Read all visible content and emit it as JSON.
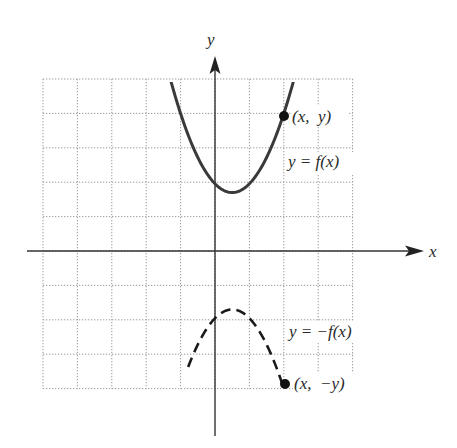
{
  "figure": {
    "axes": {
      "x_label": "x",
      "y_label": "y"
    },
    "grid": {
      "x_min": -5,
      "x_max": 4,
      "y_min": -4,
      "y_max": 5,
      "step": 1,
      "style": "dotted",
      "color": "#9a9a9a"
    },
    "curves": [
      {
        "name": "f",
        "label": "y = f(x)",
        "style": "solid",
        "color": "#3a3a3a"
      },
      {
        "name": "neg_f",
        "label": "y = −f(x)",
        "style": "dashed",
        "color": "#1a1a1a"
      }
    ],
    "points": [
      {
        "label": "(x,  y)",
        "x": 2,
        "y": 4
      },
      {
        "label": "(x,  −y)",
        "x": 2,
        "y": -4
      }
    ]
  },
  "chart_data": {
    "type": "line",
    "title": "",
    "xlabel": "x",
    "ylabel": "y",
    "xlim": [
      -5,
      4
    ],
    "ylim": [
      -4,
      5
    ],
    "grid": true,
    "tick_labels_shown": false,
    "series": [
      {
        "name": "y = f(x)",
        "style": "solid",
        "formula_approx": "y = 1.02*(x-0.5)^2 + 1.7",
        "x": [
          -1.3,
          -1.0,
          -0.5,
          0.0,
          0.5,
          1.0,
          1.5,
          2.0,
          2.3
        ],
        "y": [
          5.0,
          4.0,
          2.7,
          1.96,
          1.7,
          1.96,
          2.72,
          4.0,
          5.0
        ]
      },
      {
        "name": "y = -f(x)",
        "style": "dashed",
        "formula_approx": "y = -(1.02*(x-0.5)^2 + 1.7)",
        "x": [
          -0.7,
          -0.5,
          0.0,
          0.5,
          1.0,
          1.5,
          2.0,
          2.2
        ],
        "y": [
          -3.17,
          -2.72,
          -1.96,
          -1.7,
          -1.96,
          -2.72,
          -4.0,
          -4.65
        ]
      }
    ],
    "annotations": [
      {
        "text": "(x, y)",
        "at": [
          2,
          4
        ]
      },
      {
        "text": "y = f(x)",
        "at": [
          2.1,
          3.0
        ]
      },
      {
        "text": "y = −f(x)",
        "at": [
          2.1,
          -2.5
        ]
      },
      {
        "text": "(x, −y)",
        "at": [
          2,
          -4
        ]
      }
    ]
  }
}
